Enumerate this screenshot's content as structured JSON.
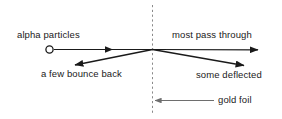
{
  "diagram": {
    "background_color": "#ffffff",
    "stroke_color": "#1a1a1a",
    "foil_line_color": "#8a8a8a",
    "pointer_color": "#6e6e6e",
    "labels": {
      "alpha_particles": "alpha particles",
      "most_pass_through": "most pass through",
      "a_few_bounce_back": "a few bounce back",
      "some_deflected": "some deflected",
      "gold_foil": "gold foil"
    },
    "elements": {
      "source_marker": "open-circle",
      "foil": "vertical-dashed-line",
      "incident_beam": "rightward-arrow",
      "transmitted_beam": "rightward-arrow",
      "backscattered_beam": "down-left-arrow",
      "deflected_beam": "down-right-arrow",
      "foil_callout": "leftward-arrow"
    }
  }
}
